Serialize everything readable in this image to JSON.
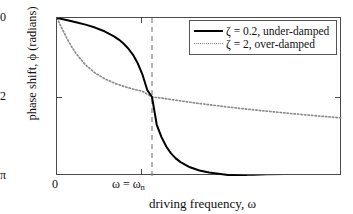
{
  "chart_data": {
    "type": "line",
    "title": "",
    "xlabel": "driving frequency, ω",
    "ylabel": "phase shift, ϕ (radians)",
    "xlim": [
      0,
      3
    ],
    "ylim": [
      -3.14159,
      0
    ],
    "grid": false,
    "legend_position": "top-right",
    "xticks": [
      {
        "value": 0,
        "label": "0"
      },
      {
        "value": 1,
        "label": "ω = ω",
        "sublabel": "n"
      }
    ],
    "yticks": [
      {
        "value": 0,
        "label": "0"
      },
      {
        "value": -1.5708,
        "label": "-π/2"
      },
      {
        "value": -3.14159,
        "label": "-π"
      }
    ],
    "annotations": [
      {
        "name": "resonance-line",
        "type": "vertical-dashed",
        "x": 1
      }
    ],
    "series": [
      {
        "name": "ζ = 0.2, under-damped",
        "zeta": 0.2,
        "style": "solid",
        "color": "#000000",
        "x": [
          0.0,
          0.1,
          0.2,
          0.3,
          0.4,
          0.5,
          0.6,
          0.65,
          0.7,
          0.75,
          0.8,
          0.85,
          0.9,
          0.95,
          1.0,
          1.05,
          1.1,
          1.15,
          1.2,
          1.25,
          1.3,
          1.4,
          1.5,
          1.6,
          1.8,
          2.0,
          2.2,
          2.5,
          2.8,
          3.0
        ],
        "y": [
          0.0,
          -0.0404,
          -0.0833,
          -0.1319,
          -0.1903,
          -0.2644,
          -0.364,
          -0.4286,
          -0.5077,
          -0.6064,
          -0.7328,
          -0.9,
          -1.1279,
          -1.4308,
          -1.5708,
          -2.1232,
          -2.3696,
          -2.5547,
          -2.6906,
          -2.791,
          -2.8663,
          -2.9688,
          -3.032,
          -3.0732,
          -3.12,
          -3.1423,
          -3.1545,
          -3.1645,
          -3.1697,
          -3.1719
        ]
      },
      {
        "name": "ζ = 2, over-damped",
        "zeta": 2,
        "style": "dotted",
        "color": "#8a8a8a",
        "x": [
          0.0,
          0.05,
          0.1,
          0.15,
          0.2,
          0.3,
          0.4,
          0.5,
          0.6,
          0.7,
          0.8,
          0.9,
          1.0,
          1.1,
          1.2,
          1.3,
          1.4,
          1.6,
          1.8,
          2.0,
          2.2,
          2.5,
          2.8,
          3.0
        ],
        "y": [
          0.0,
          -0.1996,
          -0.3886,
          -0.5586,
          -0.7055,
          -0.9327,
          -1.0917,
          -1.2059,
          -1.2915,
          -1.3584,
          -1.4125,
          -1.4576,
          -1.5708,
          -1.5914,
          -1.6214,
          -1.6493,
          -1.6756,
          -1.7243,
          -1.7694,
          -1.8116,
          -1.8513,
          -1.906,
          -1.9565,
          -1.9877
        ]
      }
    ]
  },
  "legend": {
    "entries": [
      {
        "label": "ζ = 0.2, under-damped",
        "style": "solid"
      },
      {
        "label": "ζ = 2, over-damped",
        "style": "dotted"
      }
    ]
  },
  "axes": {
    "y_label": "phase shift, ϕ (radians)",
    "x_label": "driving frequency, ω",
    "y_tick_0": "0",
    "y_tick_half_pi": "-π/2",
    "y_tick_pi": "-π",
    "x_tick_zero": "0",
    "x_tick_resonance_main": "ω = ω",
    "x_tick_resonance_sub": "n"
  },
  "colors": {
    "under_damped": "#000000",
    "over_damped": "#8a8a8a",
    "frame": "#4a4a4a",
    "resonance_line": "#777777",
    "background": "#ffffff"
  }
}
